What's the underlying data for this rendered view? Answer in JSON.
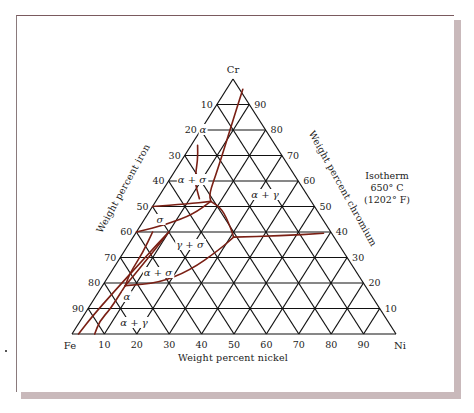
{
  "figure": {
    "corners": {
      "top": "Cr",
      "left": "Fe",
      "right": "Ni"
    },
    "axis_labels": {
      "left": "Weight percent iron",
      "right": "Weight percent chromium",
      "bottom": "Weight percent nickel"
    },
    "isotherm": {
      "line1": "Isotherm",
      "line2": "650° C",
      "line3": "(1202° F)"
    },
    "ticks": {
      "iron": [
        "10",
        "20",
        "30",
        "40",
        "50",
        "60",
        "70",
        "80",
        "90"
      ],
      "chromium": [
        "90",
        "80",
        "70",
        "60",
        "50",
        "40",
        "30",
        "20",
        "10"
      ],
      "nickel": [
        "10",
        "20",
        "30",
        "40",
        "50",
        "60",
        "70",
        "80",
        "90"
      ]
    },
    "regions": [
      {
        "label": "α",
        "x": 203,
        "y": 133
      },
      {
        "label": "α + σ",
        "x": 192,
        "y": 183
      },
      {
        "label": "α + γ",
        "x": 265,
        "y": 198
      },
      {
        "label": "σ",
        "x": 160,
        "y": 223
      },
      {
        "label": "γ + σ",
        "x": 190,
        "y": 248
      },
      {
        "label": "α + σ",
        "x": 158,
        "y": 276
      },
      {
        "label": "α",
        "x": 127,
        "y": 300
      },
      {
        "label": "α + γ",
        "x": 134,
        "y": 326
      }
    ],
    "colors": {
      "grid": "#111111",
      "phase_boundary": "#7a1f14",
      "shadow": "#c9b9bb"
    }
  },
  "chart_data": {
    "type": "ternary",
    "vertices": [
      "Cr",
      "Fe",
      "Ni"
    ],
    "axes": {
      "iron": {
        "label": "Weight percent iron",
        "ticks": [
          10,
          20,
          30,
          40,
          50,
          60,
          70,
          80,
          90
        ]
      },
      "chromium": {
        "label": "Weight percent chromium",
        "ticks": [
          10,
          20,
          30,
          40,
          50,
          60,
          70,
          80,
          90
        ]
      },
      "nickel": {
        "label": "Weight percent nickel",
        "ticks": [
          10,
          20,
          30,
          40,
          50,
          60,
          70,
          80,
          90
        ]
      }
    },
    "grid_step": 10,
    "phase_regions": [
      "α",
      "α + σ",
      "α + γ",
      "σ",
      "γ + σ",
      "α + σ",
      "α",
      "α + γ"
    ],
    "boundaries_note": "Phase boundaries (curves in Ni/Cr wt%)",
    "boundaries": [
      {
        "name": "alpha-upper-right",
        "points_ni_cr": [
          [
            5,
            96
          ],
          [
            9,
            80
          ],
          [
            13,
            64
          ],
          [
            15,
            55
          ],
          [
            17,
            52
          ]
        ]
      },
      {
        "name": "alpha-upper-left",
        "points_ni_cr": [
          [
            2,
            74
          ],
          [
            5,
            68
          ],
          [
            8,
            60
          ],
          [
            13,
            53
          ]
        ]
      },
      {
        "name": "sigma-top",
        "points_ni_cr": [
          [
            0,
            50
          ],
          [
            10,
            51
          ],
          [
            17,
            52
          ]
        ]
      },
      {
        "name": "sigma-mid",
        "points_ni_cr": [
          [
            17,
            52
          ],
          [
            22,
            49
          ],
          [
            28,
            42
          ],
          [
            31,
            38
          ]
        ]
      },
      {
        "name": "gamma-right",
        "points_ni_cr": [
          [
            31,
            38
          ],
          [
            45,
            38.5
          ],
          [
            58,
            39.5
          ]
        ]
      },
      {
        "name": "sigma-lower",
        "points_ni_cr": [
          [
            0,
            40
          ],
          [
            8,
            43
          ],
          [
            14,
            47
          ],
          [
            17,
            52
          ]
        ]
      },
      {
        "name": "gamma-sigma-lower",
        "points_ni_cr": [
          [
            31,
            38
          ],
          [
            29,
            33
          ],
          [
            24,
            25
          ],
          [
            17,
            20
          ],
          [
            7,
            19
          ]
        ]
      },
      {
        "name": "left-alpha-1",
        "points_ni_cr": [
          [
            2,
            0
          ],
          [
            3,
            8
          ],
          [
            5,
            18
          ],
          [
            7,
            27
          ],
          [
            9,
            36
          ],
          [
            10,
            40
          ]
        ]
      },
      {
        "name": "left-alpha-2",
        "points_ni_cr": [
          [
            5,
            40
          ],
          [
            6,
            32
          ],
          [
            6,
            24
          ],
          [
            7,
            19
          ]
        ]
      },
      {
        "name": "left-alpha-3",
        "points_ni_cr": [
          [
            10,
            40
          ],
          [
            9,
            32
          ],
          [
            8,
            25
          ],
          [
            7,
            19
          ]
        ]
      },
      {
        "name": "left-alpha-4",
        "points_ni_cr": [
          [
            7,
            0
          ],
          [
            6,
            5
          ],
          [
            7,
            10
          ],
          [
            7,
            19
          ]
        ]
      }
    ]
  }
}
